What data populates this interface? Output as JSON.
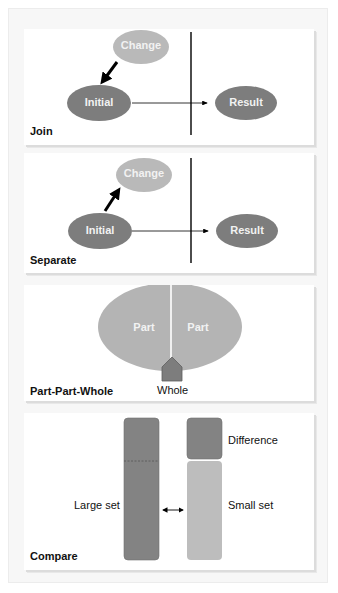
{
  "colors": {
    "dark_node": "#7d7d7d",
    "light_node": "#b9b9b9",
    "part_fill": "#b4b4b4",
    "compare_large": "#838383",
    "compare_small": "#bdbdbd",
    "node_text": "#f2f2f2",
    "line": "#000000"
  },
  "panels": [
    {
      "id": "join",
      "label": "Join",
      "nodes": {
        "change": "Change",
        "initial": "Initial",
        "result": "Result"
      },
      "change_arrow_direction": "change-to-initial"
    },
    {
      "id": "separate",
      "label": "Separate",
      "nodes": {
        "change": "Change",
        "initial": "Initial",
        "result": "Result"
      },
      "change_arrow_direction": "initial-to-change"
    },
    {
      "id": "part-part-whole",
      "label": "Part-Part-Whole",
      "parts": [
        "Part",
        "Part"
      ],
      "whole": "Whole"
    },
    {
      "id": "compare",
      "label": "Compare",
      "large_set": "Large set",
      "small_set": "Small set",
      "difference": "Difference"
    }
  ]
}
